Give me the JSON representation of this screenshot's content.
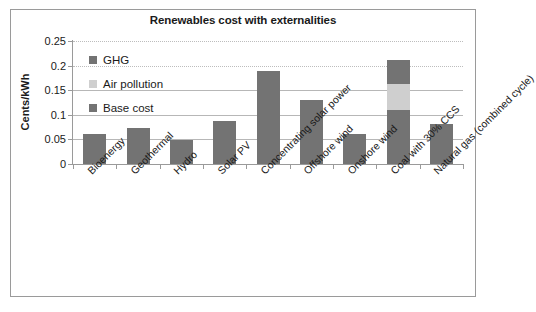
{
  "chart_data": {
    "type": "bar",
    "title": "Renewables cost with externalities",
    "xlabel": "",
    "ylabel": "Cents/kWh",
    "ylim": [
      0,
      0.25
    ],
    "ytick_labels": [
      "0",
      "0.05",
      "0.1",
      "0.15",
      "0.2",
      "0.25"
    ],
    "ytick_values": [
      0,
      0.05,
      0.1,
      0.15,
      0.2,
      0.25
    ],
    "grid": true,
    "stacked": true,
    "legend_position": "inside-top-left",
    "categories": [
      "Bioenergy",
      "Geothermal",
      "Hydro",
      "Solar PV",
      "Concentrating solar power",
      "Offshore wind",
      "Onshore wind",
      "Coal with 30% CCS",
      "Natural gas (combined cycle)"
    ],
    "series": [
      {
        "name": "Base cost",
        "color": "#737373",
        "values": [
          0.062,
          0.073,
          0.049,
          0.088,
          0.19,
          0.131,
          0.061,
          0.11,
          0.057
        ]
      },
      {
        "name": "Air pollution",
        "color": "#cfcfcf",
        "values": [
          0,
          0,
          0,
          0,
          0,
          0,
          0,
          0.052,
          0
        ]
      },
      {
        "name": "GHG",
        "color": "#737373",
        "values": [
          0,
          0,
          0,
          0,
          0,
          0,
          0,
          0.049,
          0.024
        ]
      }
    ],
    "totals": [
      0.062,
      0.073,
      0.049,
      0.088,
      0.19,
      0.131,
      0.061,
      0.211,
      0.081
    ]
  },
  "legend": {
    "items": [
      {
        "label": "GHG"
      },
      {
        "label": "Air pollution"
      },
      {
        "label": "Base cost"
      }
    ]
  }
}
